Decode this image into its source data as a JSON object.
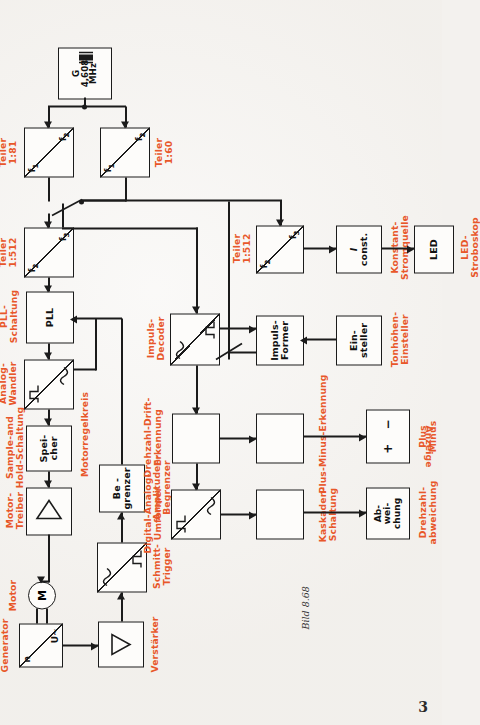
{
  "figure": {
    "caption": "Bild 8.68",
    "page_number": "3"
  },
  "blocks": {
    "motor": {
      "symbol": "M",
      "label": "Motor"
    },
    "freq_gen": {
      "top": "n",
      "bottom": "U~",
      "label_l1": "Frequenz-",
      "label_l2": "Generator"
    },
    "verstaerker": {
      "symbol": "triangle",
      "label": "Verstärker"
    },
    "schmitt": {
      "label_l1": "Schmitt-",
      "label_l2": "Trigger"
    },
    "begrenzer": {
      "text_l1": "Be -",
      "text_l2": "grenzer",
      "label_l1": "Amplituden-",
      "label_l2": "Begrenzer"
    },
    "motor_treiber": {
      "symbol": "triangle",
      "label_l1": "Motor-",
      "label_l2": "Treiber"
    },
    "speicher": {
      "text_l1": "Spei-",
      "text_l2": "cher",
      "label_l1": "Sample-and",
      "label_l2": "Hold-Schaltung"
    },
    "da_wandler": {
      "label_l1": "Digital-",
      "label_l2": "Analog-",
      "label_l3": "Wandler"
    },
    "pll": {
      "text": "PLL",
      "label_l1": "PLL-",
      "label_l2": "Schaltung"
    },
    "teiler512a": {
      "top": "f2",
      "bottom": "f3",
      "label_l1": "Teiler",
      "label_l2": "1:512"
    },
    "teiler81": {
      "top": "f1",
      "bottom": "f2",
      "label_l1": "Teiler",
      "label_l2": "1:81"
    },
    "teiler60": {
      "top": "f1",
      "bottom": "f2",
      "label_l1": "Teiler",
      "label_l2": "1:60"
    },
    "oszillator": {
      "text_l1": "G",
      "text_l2": "4,608",
      "text_l3": "MHz"
    },
    "impuls_decoder": {
      "label_l1": "Impuls-",
      "label_l2": "Decoder"
    },
    "teiler512b": {
      "top": "f2",
      "bottom": "f3",
      "label_l1": "Teiler",
      "label_l2": "1:512"
    },
    "impuls_former": {
      "text_l1": "Impuls-",
      "text_l2": "Former"
    },
    "einsteller": {
      "text_l1": "Ein-",
      "text_l2": "steller",
      "label_l1": "Tonhöhen-",
      "label_l2": "Einsteller"
    },
    "konstantstrom": {
      "text_l1": "I",
      "text_l2": "const.",
      "label_l1": "Konstant-",
      "label_l2": "Stromquelle"
    },
    "led": {
      "text": "LED",
      "label_l1": "LED-",
      "label_l2": "Stroboskop"
    },
    "drift": {
      "label_l1": "Drehzahl-Drift-",
      "label_l2": "Erkennung"
    },
    "plusminus_erk": {
      "label": "Plus-Minus-Erkennung"
    },
    "plusminus_disp": {
      "plus": "+",
      "minus": "−",
      "label_l1": "Plus",
      "label_l2": "Minus"
    },
    "da_umformer": {
      "label_l1": "Digital-Analog-",
      "label_l2": "Umformer"
    },
    "kaskade": {
      "label_l1": "Kaskaden-",
      "label_l2": "Schaltung"
    },
    "abweichung": {
      "text_l1": "Ab-",
      "text_l2": "wei-",
      "text_l3": "chung",
      "label_l1": "Drehzahl-",
      "label_l2": "abweichung"
    }
  },
  "annotations": {
    "motorregelkreis": "Motorregelkreis",
    "anzeige": "Anzeige"
  },
  "colors": {
    "ink": "#1b1b1b",
    "annotation": "#e8572a",
    "paper": "#f4f2ef"
  }
}
